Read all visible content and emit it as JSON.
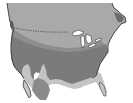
{
  "map": {
    "title": "North America zone map",
    "colors": {
      "background": "#ffffff",
      "north_zone": "#a9a9a9",
      "mid_zone": "#8e8e8e",
      "main_zone": "#7d7d7d",
      "south_light_zone": "#c4c4c4",
      "mexico_zone": "#8a8a8a",
      "coast_outline": "#3a3a3a",
      "lakes": "#ffffff",
      "border_line": "#333333"
    },
    "features": [
      "north-zone",
      "border-dotted-line",
      "great-lakes",
      "mid-zone",
      "main-zone",
      "southwest-light-zone",
      "gulf-coast-light-zone",
      "florida",
      "mexico-zone"
    ]
  }
}
